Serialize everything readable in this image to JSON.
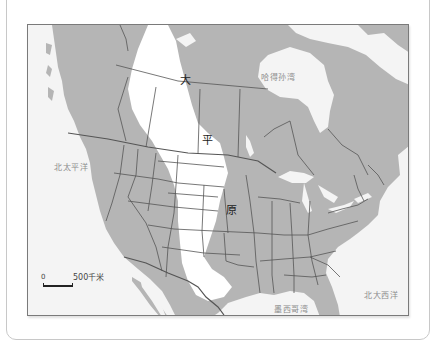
{
  "map": {
    "title_region": "北美洲大平原",
    "plains_label_chars": [
      "大",
      "平",
      "原"
    ],
    "water_labels": {
      "hudson_bay": "哈得孙湾",
      "north_pacific": "北太平洋",
      "north_atlantic": "北大西洋",
      "gulf_of_mexico": "墨西哥湾"
    },
    "scale_bar": {
      "start": "0",
      "end": "500千米"
    },
    "colors": {
      "land": "#b5b5b5",
      "water": "#f4f4f4",
      "plains": "#ffffff",
      "borders": "#555555",
      "frame": "#7a7a7a"
    }
  }
}
